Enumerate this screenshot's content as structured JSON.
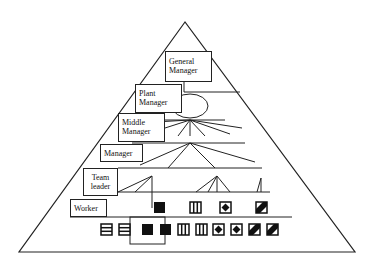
{
  "diagram": {
    "type": "organizational-pyramid",
    "levels": [
      {
        "id": "general-manager",
        "label": "General Manager",
        "line1": "General",
        "line2": "Manager"
      },
      {
        "id": "plant-manager",
        "label": "Plant Manager",
        "line1": "Plant",
        "line2": "Manager"
      },
      {
        "id": "middle-manager",
        "label": "Middle Manager",
        "line1": "Middle",
        "line2": "Manager"
      },
      {
        "id": "manager",
        "label": "Manager",
        "line1": "Manager"
      },
      {
        "id": "team-leader",
        "label": "Team leader",
        "line1": "Team",
        "line2": "leader"
      },
      {
        "id": "worker",
        "label": "Worker",
        "line1": "Worker"
      }
    ],
    "worker_symbols": [
      "horizontal-stripes",
      "solid-black",
      "vertical-stripes",
      "diamond-in-square",
      "diagonal-stripe"
    ],
    "bottom_symbols": [
      "horizontal-stripes",
      "horizontal-stripes",
      "solid-black",
      "solid-black",
      "vertical-stripes",
      "vertical-stripes",
      "diamond-in-square",
      "diamond-in-square",
      "diagonal-stripe",
      "diagonal-stripe"
    ],
    "colors": {
      "line": "#222222",
      "fill": "#111111",
      "background": "#ffffff"
    }
  }
}
